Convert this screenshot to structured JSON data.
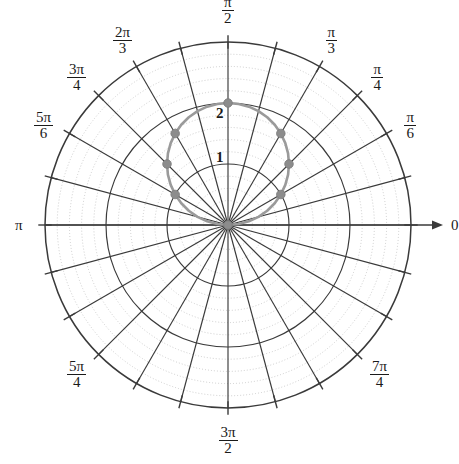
{
  "figure": {
    "type": "polar-plot",
    "background": "#ffffff",
    "center_px": [
      228,
      225
    ],
    "outer_radius_px": 183
  },
  "chart_data": {
    "type": "line",
    "coordinate_system": "polar",
    "title": "",
    "xlabel": "",
    "ylabel": "",
    "equation_label": "r = 2 sin(theta)",
    "rlim": [
      0,
      3
    ],
    "r_major_ticks": [
      1,
      2,
      3
    ],
    "r_minor_ticks": [
      0.2,
      0.4,
      0.6,
      0.8,
      1.2,
      1.4,
      1.6,
      1.8,
      2.2,
      2.4,
      2.6,
      2.8
    ],
    "r_tick_labels_shown": [
      "1",
      "2"
    ],
    "theta_tick_labels": [
      "0",
      "π/6",
      "π/4",
      "π/3",
      "π/2",
      "2π/3",
      "3π/4",
      "5π/6",
      "π",
      "5π/4",
      "3π/2",
      "7π/4"
    ],
    "grid": true,
    "legend": "none",
    "series": [
      {
        "name": "r = 2 sin(theta)",
        "color": "#9a9a9a",
        "theta_deg": [
          0,
          5,
          10,
          15,
          20,
          25,
          30,
          35,
          40,
          45,
          50,
          55,
          60,
          65,
          70,
          75,
          80,
          85,
          90,
          95,
          100,
          105,
          110,
          115,
          120,
          125,
          130,
          135,
          140,
          145,
          150,
          155,
          160,
          165,
          170,
          175,
          180
        ],
        "r": [
          0.0,
          0.174,
          0.347,
          0.518,
          0.684,
          0.845,
          1.0,
          1.147,
          1.286,
          1.414,
          1.532,
          1.638,
          1.732,
          1.813,
          1.879,
          1.932,
          1.97,
          1.992,
          2.0,
          1.992,
          1.97,
          1.932,
          1.879,
          1.813,
          1.732,
          1.638,
          1.532,
          1.414,
          1.286,
          1.147,
          1.0,
          0.845,
          0.684,
          0.518,
          0.347,
          0.174,
          0.0
        ]
      }
    ],
    "markers": {
      "color": "#8c8c8c",
      "points": [
        {
          "theta_label": "0",
          "theta_deg": 0,
          "r": 0
        },
        {
          "theta_label": "π/6",
          "theta_deg": 30,
          "r": 1
        },
        {
          "theta_label": "π/4",
          "theta_deg": 45,
          "r": 1.414
        },
        {
          "theta_label": "π/3",
          "theta_deg": 60,
          "r": 1.732
        },
        {
          "theta_label": "π/2",
          "theta_deg": 90,
          "r": 2
        },
        {
          "theta_label": "2π/3",
          "theta_deg": 120,
          "r": 1.732
        },
        {
          "theta_label": "3π/4",
          "theta_deg": 135,
          "r": 1.414
        },
        {
          "theta_label": "5π/6",
          "theta_deg": 150,
          "r": 1
        }
      ]
    }
  },
  "axis_labels": {
    "zero": {
      "text": "0",
      "kind": "plain"
    },
    "pi": {
      "text": "π",
      "kind": "plain"
    },
    "pi_over_6": {
      "num": "π",
      "den": "6",
      "kind": "frac"
    },
    "pi_over_4": {
      "num": "π",
      "den": "4",
      "kind": "frac"
    },
    "pi_over_3": {
      "num": "π",
      "den": "3",
      "kind": "frac"
    },
    "pi_over_2": {
      "num": "π",
      "den": "2",
      "kind": "frac"
    },
    "two_pi_over_3": {
      "num": "2π",
      "den": "3",
      "kind": "frac"
    },
    "three_pi_over_4": {
      "num": "3π",
      "den": "4",
      "kind": "frac"
    },
    "five_pi_over_6": {
      "num": "5π",
      "den": "6",
      "kind": "frac"
    },
    "five_pi_over_4": {
      "num": "5π",
      "den": "4",
      "kind": "frac"
    },
    "three_pi_over_2": {
      "num": "3π",
      "den": "2",
      "kind": "frac"
    },
    "seven_pi_over_4": {
      "num": "7π",
      "den": "4",
      "kind": "frac"
    }
  },
  "radial_labels": {
    "one": "1",
    "two": "2"
  },
  "colors": {
    "grid_major": "#3a3a3a",
    "grid_minor": "#b9b9b9",
    "curve": "#9a9a9a",
    "marker": "#8c8c8c",
    "text": "#1a1a1a",
    "background": "#ffffff"
  }
}
